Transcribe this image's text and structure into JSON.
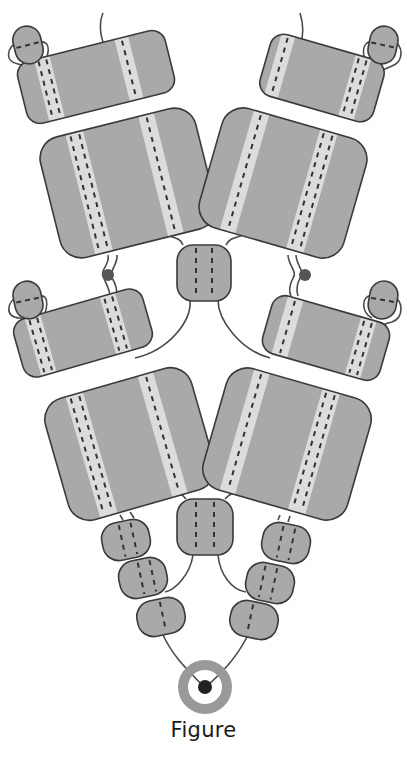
{
  "caption": "Figure",
  "colors": {
    "block_fill": "#a9a9a9",
    "block_stroke": "#3a3a3a",
    "stripe": "#dcdcdc",
    "dash": "#333333",
    "wire": "#4a4a4a",
    "dot": "#555555",
    "ring": "#999999",
    "ring_center": "#222222"
  },
  "blocks": [
    {
      "id": "L1-top",
      "cx": 96,
      "cy": 77,
      "w": 152,
      "h": 64,
      "rot": -14,
      "r": 14,
      "stripes": [
        {
          "x": -48,
          "w": 16,
          "dashes": 2
        },
        {
          "x": 34,
          "w": 14,
          "dashes": 1
        }
      ]
    },
    {
      "id": "L1-big",
      "cx": 128,
      "cy": 183,
      "w": 160,
      "h": 124,
      "rot": -14,
      "r": 22,
      "stripes": [
        {
          "x": -40,
          "w": 18,
          "dashes": 2
        },
        {
          "x": 34,
          "w": 16,
          "dashes": 1
        }
      ]
    },
    {
      "id": "R1-top",
      "cx": 322,
      "cy": 78,
      "w": 118,
      "h": 64,
      "rot": 16,
      "r": 14,
      "stripes": [
        {
          "x": -44,
          "w": 14,
          "dashes": 1
        },
        {
          "x": 34,
          "w": 16,
          "dashes": 2
        }
      ]
    },
    {
      "id": "R1-big",
      "cx": 283,
      "cy": 183,
      "w": 150,
      "h": 124,
      "rot": 16,
      "r": 22,
      "stripes": [
        {
          "x": -40,
          "w": 16,
          "dashes": 1
        },
        {
          "x": 30,
          "w": 18,
          "dashes": 2
        }
      ]
    },
    {
      "id": "C1",
      "cx": 204,
      "cy": 273,
      "w": 54,
      "h": 56,
      "rot": 0,
      "r": 16,
      "stripes": [
        {
          "x": -8,
          "w": 0,
          "dashes": 1
        },
        {
          "x": 8,
          "w": 0,
          "dashes": 1
        }
      ]
    },
    {
      "id": "L2-top",
      "cx": 83,
      "cy": 333,
      "w": 134,
      "h": 60,
      "rot": -16,
      "r": 14,
      "stripes": [
        {
          "x": -44,
          "w": 16,
          "dashes": 2
        },
        {
          "x": 34,
          "w": 16,
          "dashes": 2
        }
      ]
    },
    {
      "id": "L2-big",
      "cx": 130,
      "cy": 444,
      "w": 152,
      "h": 126,
      "rot": -16,
      "r": 22,
      "stripes": [
        {
          "x": -40,
          "w": 18,
          "dashes": 2
        },
        {
          "x": 34,
          "w": 16,
          "dashes": 1
        }
      ]
    },
    {
      "id": "R2-top",
      "cx": 326,
      "cy": 338,
      "w": 122,
      "h": 60,
      "rot": 16,
      "r": 14,
      "stripes": [
        {
          "x": -40,
          "w": 16,
          "dashes": 1
        },
        {
          "x": 36,
          "w": 16,
          "dashes": 2
        }
      ]
    },
    {
      "id": "R2-big",
      "cx": 287,
      "cy": 444,
      "w": 150,
      "h": 126,
      "rot": 16,
      "r": 22,
      "stripes": [
        {
          "x": -44,
          "w": 16,
          "dashes": 1
        },
        {
          "x": 28,
          "w": 18,
          "dashes": 2
        }
      ]
    },
    {
      "id": "C2",
      "cx": 205,
      "cy": 527,
      "w": 56,
      "h": 56,
      "rot": 0,
      "r": 16,
      "stripes": [
        {
          "x": -9,
          "w": 0,
          "dashes": 1
        },
        {
          "x": 9,
          "w": 0,
          "dashes": 1
        }
      ]
    },
    {
      "id": "L3a",
      "cx": 126,
      "cy": 540,
      "w": 48,
      "h": 38,
      "rot": -12,
      "r": 16,
      "stripes": [
        {
          "x": -4,
          "w": 0,
          "dashes": 1
        },
        {
          "x": 8,
          "w": 0,
          "dashes": 1
        }
      ]
    },
    {
      "id": "L3b",
      "cx": 143,
      "cy": 578,
      "w": 48,
      "h": 38,
      "rot": -12,
      "r": 16,
      "stripes": [
        {
          "x": -2,
          "w": 0,
          "dashes": 1
        },
        {
          "x": 10,
          "w": 0,
          "dashes": 1
        }
      ]
    },
    {
      "id": "L3c",
      "cx": 161,
      "cy": 617,
      "w": 48,
      "h": 36,
      "rot": -12,
      "r": 16,
      "stripes": [
        {
          "x": 2,
          "w": 0,
          "dashes": 1
        }
      ]
    },
    {
      "id": "R3a",
      "cx": 286,
      "cy": 543,
      "w": 48,
      "h": 38,
      "rot": 12,
      "r": 16,
      "stripes": [
        {
          "x": -6,
          "w": 0,
          "dashes": 1
        },
        {
          "x": 6,
          "w": 0,
          "dashes": 1
        }
      ]
    },
    {
      "id": "R3b",
      "cx": 270,
      "cy": 583,
      "w": 48,
      "h": 38,
      "rot": 12,
      "r": 16,
      "stripes": [
        {
          "x": -8,
          "w": 0,
          "dashes": 1
        },
        {
          "x": 4,
          "w": 0,
          "dashes": 1
        }
      ]
    },
    {
      "id": "R3c",
      "cx": 254,
      "cy": 620,
      "w": 48,
      "h": 36,
      "rot": 12,
      "r": 16,
      "stripes": [
        {
          "x": -4,
          "w": 0,
          "dashes": 1
        }
      ]
    }
  ],
  "capsules": [
    {
      "id": "L1-cap",
      "cx": 28,
      "cy": 45,
      "rx": 14,
      "ry": 19,
      "rot": -14
    },
    {
      "id": "R1-cap",
      "cx": 383,
      "cy": 45,
      "rx": 14,
      "ry": 19,
      "rot": 12
    },
    {
      "id": "L2-cap",
      "cx": 28,
      "cy": 300,
      "rx": 14,
      "ry": 19,
      "rot": -12
    },
    {
      "id": "R2-cap",
      "cx": 383,
      "cy": 300,
      "rx": 14,
      "ry": 19,
      "rot": 10
    }
  ],
  "wires": [
    "M103,13 C98,25 101,40 106,48",
    "M300,13 C304,25 303,38 300,48",
    "M20,40 C5,48 5,62 18,64 C28,66 38,70 43,73",
    "M40,42 C52,40 50,58 40,66 C36,68 38,72 43,75",
    "M392,40 C405,46 403,62 392,66 C383,70 378,72 370,75",
    "M372,42 C362,40 360,58 370,64",
    "M20,295 C5,302 5,318 20,318 C30,318 36,322 38,325",
    "M40,296 C50,294 48,312 40,320",
    "M392,295 C405,302 403,318 392,322 C383,324 378,327 372,330",
    "M372,296 C362,294 360,312 372,318",
    "M108,255 C110,265 100,270 103,276 C106,284 110,290 110,296",
    "M117,255 C118,265 108,272 112,278 C116,284 117,290 117,296",
    "M296,255 C296,265 306,272 300,278 C297,284 296,290 298,296",
    "M288,255 C288,265 298,272 293,278 C290,284 288,290 291,296",
    "M183,245 C180,236 170,238 160,232",
    "M226,245 C230,236 240,238 250,232",
    "M190,300 C192,320 170,350 135,358",
    "M218,300 C218,320 240,350 270,358",
    "M186,499 C180,490 172,494 160,490",
    "M225,499 C232,490 240,494 252,490",
    "M193,555 C190,575 175,590 165,592",
    "M218,555 C220,575 232,590 246,592",
    "M163,635 C175,660 190,672 205,688",
    "M247,637 C235,660 222,672 205,688",
    "M120,515 L123,520",
    "M130,512 L134,518",
    "M290,516 L288,522",
    "M280,515 L278,520"
  ],
  "dots": [
    {
      "id": "L-joint",
      "cx": 108,
      "cy": 275,
      "r": 6
    },
    {
      "id": "R-joint",
      "cx": 305,
      "cy": 275,
      "r": 6
    }
  ],
  "ring": {
    "cx": 205,
    "cy": 687,
    "r_outer": 27,
    "r_inner": 17,
    "center_r": 7
  }
}
